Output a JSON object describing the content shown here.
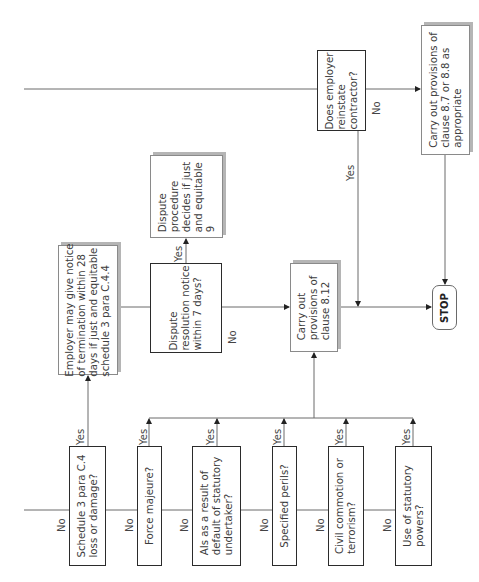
{
  "diagram": {
    "orientation": "rotated-90-ccw",
    "nodes": {
      "schedule3": {
        "text": "Schedule 3 para C.4\nloss or damage?",
        "type": "decision"
      },
      "force_majeure": {
        "text": "Force majeure?",
        "type": "decision"
      },
      "statutory_undertaker": {
        "text": "AIs as a result of\ndefault of statutory\nundertaker?",
        "type": "decision"
      },
      "specified_perils": {
        "text": "Specified perils?",
        "type": "decision"
      },
      "civil_commotion": {
        "text": "Civil commotion or\nterrorism?",
        "type": "decision"
      },
      "statutory_powers": {
        "text": "Use of statutory\npowers?",
        "type": "decision"
      },
      "employer_notice": {
        "text": "Employer may give notice\nof termination within 28\ndays if just and equitable\nschedule 3 para C.4.4",
        "type": "process"
      },
      "dispute_resolution": {
        "text": "Dispute\nresolution notice\nwithin 7 days?",
        "type": "decision"
      },
      "dispute_procedure": {
        "text": "Dispute\nprocedure\ndecides if just\nand equitable\n9",
        "type": "process"
      },
      "clause_812": {
        "text": "Carry out\nprovisions of\nclause 8.12",
        "type": "process"
      },
      "reinstate": {
        "text": "Does employer\nreinstate\ncontractor?",
        "type": "decision"
      },
      "clause_87_88": {
        "text": "Carry out provisions of\nclause 8.7 or 8.8 as\nappropriate",
        "type": "process"
      },
      "stop": {
        "text": "STOP",
        "type": "terminator"
      }
    },
    "labels": {
      "yes": "Yes",
      "no": "No"
    },
    "edges": [
      {
        "from": "schedule3",
        "to": "employer_notice",
        "label": "Yes"
      },
      {
        "from": "schedule3",
        "to": "force_majeure",
        "label": "No"
      },
      {
        "from": "force_majeure",
        "to": "clause_812",
        "label": "Yes"
      },
      {
        "from": "force_majeure",
        "to": "statutory_undertaker",
        "label": "No"
      },
      {
        "from": "statutory_undertaker",
        "to": "clause_812",
        "label": "Yes"
      },
      {
        "from": "statutory_undertaker",
        "to": "specified_perils",
        "label": "No"
      },
      {
        "from": "specified_perils",
        "to": "clause_812",
        "label": "Yes"
      },
      {
        "from": "specified_perils",
        "to": "civil_commotion",
        "label": "No"
      },
      {
        "from": "civil_commotion",
        "to": "clause_812",
        "label": "Yes"
      },
      {
        "from": "civil_commotion",
        "to": "statutory_powers",
        "label": "No"
      },
      {
        "from": "statutory_powers",
        "to": "clause_812",
        "label": "Yes"
      },
      {
        "from": "employer_notice",
        "to": "dispute_resolution",
        "label": ""
      },
      {
        "from": "dispute_resolution",
        "to": "dispute_procedure",
        "label": "Yes"
      },
      {
        "from": "dispute_resolution",
        "to": "clause_812",
        "label": "No"
      },
      {
        "from": "clause_812",
        "to": "stop",
        "label": ""
      },
      {
        "from": "reinstate",
        "to": "stop",
        "label": "Yes"
      },
      {
        "from": "reinstate",
        "to": "clause_87_88",
        "label": "No"
      },
      {
        "from": "clause_87_88",
        "to": "stop",
        "label": ""
      }
    ]
  },
  "colors": {
    "line": "#6b6b6b",
    "bold_border": "#2b2b2b",
    "shadow": "#b5b5b5",
    "text": "#3c3c3c"
  }
}
